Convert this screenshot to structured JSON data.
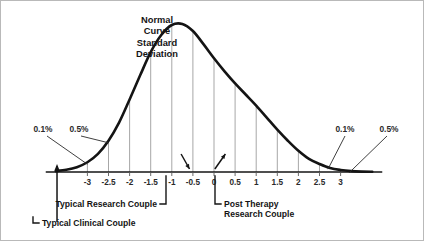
{
  "chart_data": {
    "type": "line",
    "title_lines": [
      "Normal",
      "Curve",
      "Standard",
      "Deviation"
    ],
    "xlabel": "",
    "ylabel": "",
    "xlim": [
      -3.75,
      3.75
    ],
    "ylim": [
      0,
      1
    ],
    "grid": true,
    "legend_position": "none",
    "curve_description": "standard normal bell curve, peak at 0",
    "x_tick_labels": [
      "-3",
      "-2.5",
      "-2",
      "-1.5",
      "-1",
      "-0.5",
      "0",
      "0.5",
      "1",
      "1.5",
      "2",
      "2.5",
      "3"
    ],
    "x_tick_values": [
      -3,
      -2.5,
      -2,
      -1.5,
      -1,
      -0.5,
      0,
      0.5,
      1,
      1.5,
      2,
      2.5,
      3
    ],
    "gridline_values": [
      -3,
      -2.5,
      -2,
      -1.5,
      -1,
      -0.5,
      0,
      0.5,
      1,
      1.5,
      2,
      2.5,
      3
    ],
    "series": [
      {
        "name": "Normal Curve",
        "x": [
          -3.75,
          -3.5,
          -3.25,
          -3,
          -2.75,
          -2.5,
          -2.25,
          -2,
          -1.75,
          -1.5,
          -1.25,
          -1,
          -0.75,
          -0.5,
          -0.25,
          0,
          0.25,
          0.5,
          0.75,
          1,
          1.25,
          1.5,
          1.75,
          2,
          2.25,
          2.5,
          2.75,
          3,
          3.25,
          3.5,
          3.75
        ],
        "values": [
          0.009,
          0.022,
          0.048,
          0.097,
          0.18,
          0.31,
          0.49,
          0.72,
          0.96,
          1.19,
          1.36,
          1.46,
          1.47,
          1.4,
          1.27,
          1.13,
          1.0,
          0.88,
          0.77,
          0.66,
          0.54,
          0.42,
          0.31,
          0.21,
          0.13,
          0.08,
          0.04,
          0.02,
          0.009,
          0.004,
          0.002
        ]
      }
    ],
    "annotations": [
      {
        "id": "pct-left-outer",
        "label": "0.1%",
        "points_to_x": -3.0,
        "side": "left"
      },
      {
        "id": "pct-left-inner",
        "label": "0.5%",
        "points_to_x": -2.5,
        "side": "left"
      },
      {
        "id": "pct-right-inner",
        "label": "0.1%",
        "points_to_x": 2.7,
        "side": "right"
      },
      {
        "id": "pct-right-outer",
        "label": "0.5%",
        "points_to_x": 3.2,
        "side": "right"
      }
    ],
    "callouts": [
      {
        "id": "typical-research-couple",
        "label": "Typical Research Couple",
        "lines": [
          "Typical Research Couple"
        ],
        "points_to_x": -0.7
      },
      {
        "id": "post-therapy-research-couple",
        "label": "Post Therapy Research Couple",
        "lines": [
          "Post Therapy",
          "Research Couple"
        ],
        "points_to_x": 0.25
      },
      {
        "id": "typical-clinical-couple",
        "label": "Typical Clinical Couple",
        "lines": [
          "Typical Clinical Couple"
        ],
        "points_to_x": -3.7
      }
    ],
    "colors": {
      "curve": "#141414",
      "axis": "#141414",
      "gridline": "#9d9d9d",
      "text": "#141414",
      "frame": "#b9b9b9",
      "background": "#ffffff"
    }
  }
}
